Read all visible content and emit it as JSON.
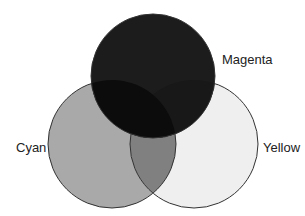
{
  "diagram": {
    "type": "venn",
    "sets": [
      {
        "id": "magenta",
        "label": "Magenta",
        "cx": 153,
        "cy": 76,
        "r": 62,
        "fill": "#1c1c1c"
      },
      {
        "id": "cyan",
        "label": "Cyan",
        "cx": 112,
        "cy": 144,
        "r": 64,
        "fill": "#a9a9a9"
      },
      {
        "id": "yellow",
        "label": "Yellow",
        "cx": 194,
        "cy": 144,
        "r": 64,
        "fill": "#efefef"
      }
    ],
    "overlaps": {
      "cyan_yellow": "#808080",
      "magenta_cyan": "#0c0c0c",
      "magenta_yellow": "#181818",
      "all": "#0c0c0c"
    },
    "stroke": "#333333",
    "labels": {
      "magenta": "Magenta",
      "cyan": "Cyan",
      "yellow": "Yellow"
    }
  }
}
